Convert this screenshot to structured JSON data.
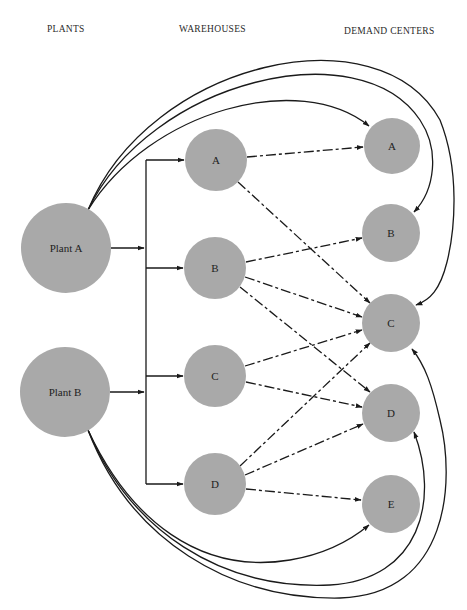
{
  "columns": {
    "plants": "PLANTS",
    "warehouses": "WAREHOUSES",
    "demand_centers": "DEMAND CENTERS"
  },
  "colors": {
    "node_fill": "#a9a9a9",
    "line": "#1a1a1a",
    "background": "#ffffff"
  },
  "plants": [
    {
      "id": "PA",
      "label": "Plant A",
      "cx": 66,
      "cy": 248,
      "r": 45
    },
    {
      "id": "PB",
      "label": "Plant B",
      "cx": 65,
      "cy": 392,
      "r": 45
    }
  ],
  "warehouses": [
    {
      "id": "WA",
      "label": "A",
      "cx": 216,
      "cy": 160,
      "r": 31
    },
    {
      "id": "WB",
      "label": "B",
      "cx": 215,
      "cy": 268,
      "r": 31
    },
    {
      "id": "WC",
      "label": "C",
      "cx": 215,
      "cy": 376,
      "r": 31
    },
    {
      "id": "WD",
      "label": "D",
      "cx": 215,
      "cy": 484,
      "r": 31
    }
  ],
  "demand_centers": [
    {
      "id": "DA",
      "label": "A",
      "cx": 392,
      "cy": 146,
      "r": 28
    },
    {
      "id": "DB",
      "label": "B",
      "cx": 391,
      "cy": 233,
      "r": 29
    },
    {
      "id": "DC",
      "label": "C",
      "cx": 391,
      "cy": 323,
      "r": 29
    },
    {
      "id": "DD",
      "label": "D",
      "cx": 391,
      "cy": 413,
      "r": 29
    },
    {
      "id": "DE",
      "label": "E",
      "cx": 391,
      "cy": 504,
      "r": 29
    }
  ],
  "plant_to_warehouse_bus": {
    "x": 146,
    "y_top": 160,
    "y_bottom": 484
  },
  "warehouse_to_demand_links": [
    {
      "from": "WA",
      "to": "DA"
    },
    {
      "from": "WA",
      "to": "DC"
    },
    {
      "from": "WB",
      "to": "DB"
    },
    {
      "from": "WB",
      "to": "DC"
    },
    {
      "from": "WB",
      "to": "DD"
    },
    {
      "from": "WC",
      "to": "DC"
    },
    {
      "from": "WC",
      "to": "DD"
    },
    {
      "from": "WD",
      "to": "DC"
    },
    {
      "from": "WD",
      "to": "DD"
    },
    {
      "from": "WD",
      "to": "DE"
    }
  ],
  "direct_plant_to_demand_links": [
    {
      "from": "PA",
      "to": "DA"
    },
    {
      "from": "PA",
      "to": "DB"
    },
    {
      "from": "PA",
      "to": "DC"
    },
    {
      "from": "PB",
      "to": "DE"
    },
    {
      "from": "PB",
      "to": "DD"
    },
    {
      "from": "PB",
      "to": "DC"
    }
  ]
}
